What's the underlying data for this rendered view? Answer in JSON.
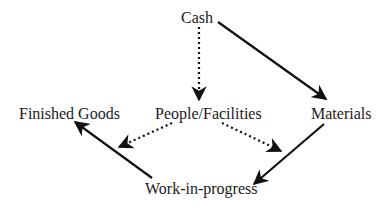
{
  "diagram": {
    "type": "flow",
    "nodes": [
      {
        "id": "cash",
        "label": "Cash"
      },
      {
        "id": "people",
        "label": "People/Facilities"
      },
      {
        "id": "finished",
        "label": "Finished Goods"
      },
      {
        "id": "materials",
        "label": "Materials"
      },
      {
        "id": "wip",
        "label": "Work-in-progress"
      }
    ],
    "edges": [
      {
        "from": "Cash",
        "to": "People/Facilities",
        "style": "dotted"
      },
      {
        "from": "Cash",
        "to": "Materials",
        "style": "solid"
      },
      {
        "from": "Materials",
        "to": "Work-in-progress",
        "style": "solid"
      },
      {
        "from": "People/Facilities",
        "to": "Work-in-progress",
        "style": "dotted"
      },
      {
        "from": "People/Facilities",
        "to": "Finished Goods",
        "style": "dotted"
      },
      {
        "from": "Work-in-progress",
        "to": "Finished Goods",
        "style": "solid"
      }
    ],
    "colors": {
      "line": "#111111",
      "text": "#1a1a1a",
      "background": "#ffffff"
    }
  }
}
